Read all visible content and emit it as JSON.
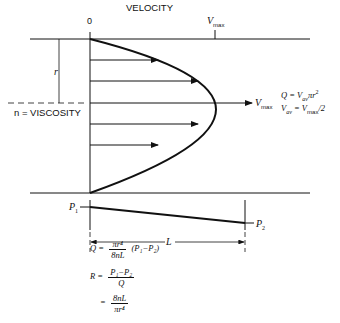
{
  "title": "VELOCITY",
  "axis": {
    "zero": "0",
    "vmax": "V",
    "vmax_sub": "max"
  },
  "labels": {
    "radius": "r",
    "viscosity": "n = VISCOSITY",
    "vmax_arrow": "V",
    "vmax_arrow_sub": "max",
    "p1": "P",
    "p1_sub": "1",
    "p2": "P",
    "p2_sub": "2",
    "length": "L"
  },
  "side_equations": {
    "q_def": "Q = V",
    "q_def_sub": "av",
    "q_def_rest": "πr",
    "q_def_sup": "2",
    "vav": "V",
    "vav_sub": "av",
    "vav_eq": " = V",
    "vav_eq_sub": "max",
    "vav_rest": "/2"
  },
  "equations": {
    "q_lhs": "Q =",
    "q_num": "πr⁴",
    "q_den": "8nL",
    "q_rhs": "(P₁−P₂)",
    "r_lhs": "R =",
    "r_num": "P₁−P₂",
    "r_den": "Q",
    "r2_lhs": "=",
    "r2_num": "8nL",
    "r2_den": "πr⁴"
  }
}
